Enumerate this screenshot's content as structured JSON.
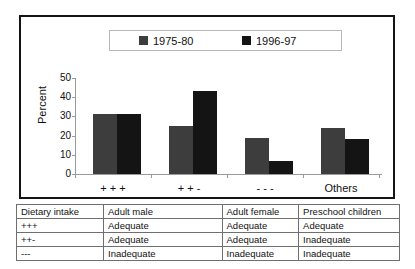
{
  "chart_data": {
    "type": "bar",
    "title": "",
    "xlabel": "",
    "ylabel": "Percent",
    "ylim": [
      0,
      50
    ],
    "yticks": [
      50,
      40,
      30,
      20,
      10,
      0
    ],
    "grid": false,
    "legend_position": "top",
    "categories": [
      "+ + +",
      "+ + -",
      "- - -",
      "Others"
    ],
    "series": [
      {
        "name": "1975-80",
        "color": "#3d3d3d",
        "values": [
          31,
          25,
          19,
          24
        ]
      },
      {
        "name": "1996-97",
        "color": "#141414",
        "values": [
          31,
          43,
          7,
          18
        ]
      }
    ]
  },
  "legend": {
    "entries": [
      {
        "label": "1975-80"
      },
      {
        "label": "1996-97"
      }
    ]
  },
  "table": {
    "headers": [
      "Dietary intake",
      "Adult male",
      "Adult female",
      "Preschool children"
    ],
    "rows": [
      [
        "+++",
        "Adequate",
        "Adequate",
        "Adequate"
      ],
      [
        "++-",
        "Adequate",
        "Adequate",
        "Inadequate"
      ],
      [
        "---",
        "Inadequate",
        "Inadequate",
        "Inadequate"
      ]
    ]
  }
}
